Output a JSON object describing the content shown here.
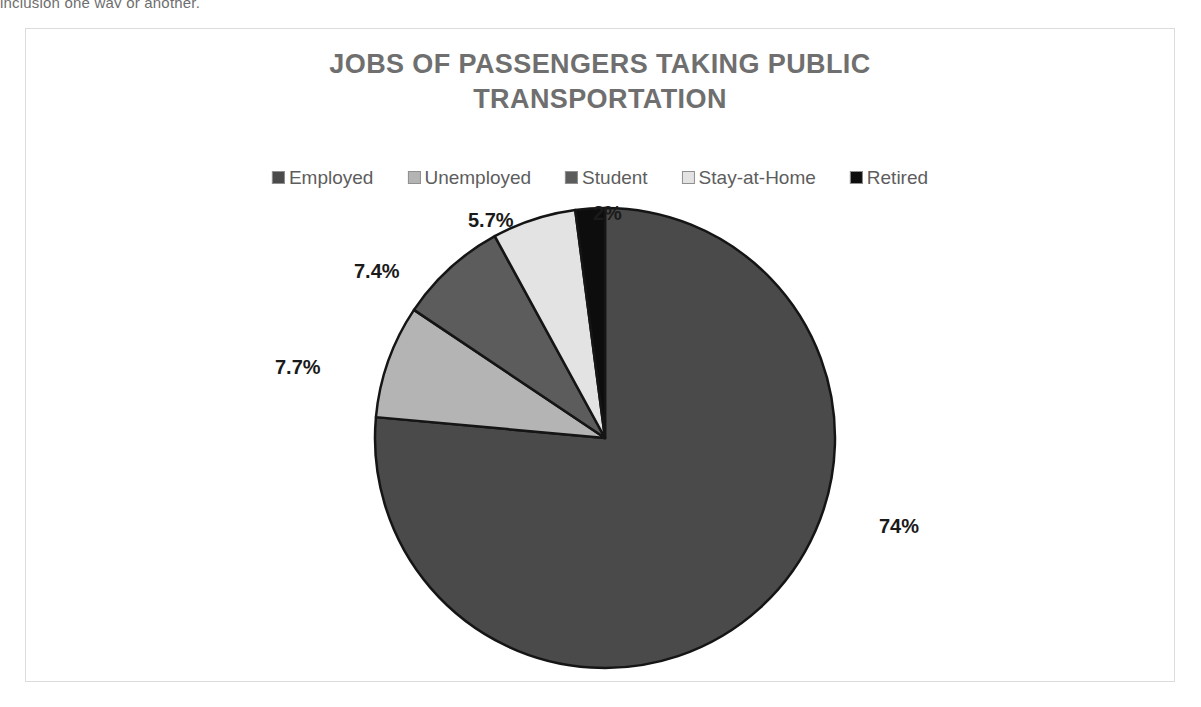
{
  "page": {
    "clipped_top_text": "inclusion one way or another."
  },
  "chart": {
    "title": "JOBS OF PASSENGERS TAKING PUBLIC TRANSPORTATION",
    "legend_position": "top"
  },
  "chart_data": {
    "type": "pie",
    "title": "JOBS OF PASSENGERS TAKING PUBLIC TRANSPORTATION",
    "xlabel": "",
    "ylabel": "",
    "legend_position": "top",
    "grid": false,
    "categories": [
      "Employed",
      "Unemployed",
      "Student",
      "Stay-at-Home",
      "Retired"
    ],
    "values": [
      74,
      7.7,
      7.4,
      5.7,
      2
    ],
    "labels": [
      "74%",
      "7.7%",
      "7.4%",
      "5.7%",
      "2%"
    ],
    "colors": [
      "#4a4a4a",
      "#b4b4b4",
      "#5c5c5c",
      "#e3e3e3",
      "#0d0d0d"
    ],
    "slice_border_color": "#151515",
    "start_angle_deg": 0,
    "direction": "clockwise",
    "slices": [
      {
        "name": "Employed",
        "value": 74,
        "label": "74%",
        "color": "#4a4a4a"
      },
      {
        "name": "Unemployed",
        "value": 7.7,
        "label": "7.7%",
        "color": "#b4b4b4"
      },
      {
        "name": "Student",
        "value": 7.4,
        "label": "7.4%",
        "color": "#5c5c5c"
      },
      {
        "name": "Stay-at-Home",
        "value": 5.7,
        "label": "5.7%",
        "color": "#e3e3e3"
      },
      {
        "name": "Retired",
        "value": 2,
        "label": "2%",
        "color": "#0d0d0d"
      }
    ]
  },
  "theme": {
    "title_color": "#6f6f6f",
    "legend_text_color": "#5d5d5d",
    "data_label_color": "#1a1a1a",
    "frame_border_color": "#dcdcdc",
    "background": "#ffffff"
  }
}
